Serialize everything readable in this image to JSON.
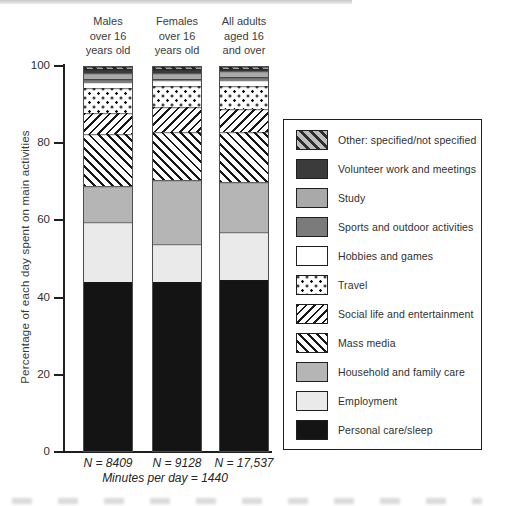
{
  "chart_data": {
    "type": "bar",
    "stacked": true,
    "title": "",
    "ylabel": "Percentage of each day spent on main activities",
    "xlabel": "",
    "ylim": [
      0,
      100
    ],
    "yticks": [
      0,
      20,
      40,
      60,
      80,
      100
    ],
    "grid": false,
    "legend_position": "right",
    "categories": [
      {
        "label_lines": [
          "Males",
          "over 16",
          "years old"
        ],
        "n_label": "N = 8409"
      },
      {
        "label_lines": [
          "Females",
          "over 16",
          "years old"
        ],
        "n_label": "N = 9128"
      },
      {
        "label_lines": [
          "All adults",
          "aged 16",
          "and over"
        ],
        "n_label": "N = 17,537"
      }
    ],
    "footnote": "Minutes per day = 1440",
    "series_bottom_to_top": [
      {
        "name": "Personal care/sleep",
        "pattern": "solid",
        "color": "#141414",
        "values": [
          44.0,
          44.0,
          44.5
        ]
      },
      {
        "name": "Employment",
        "pattern": "solid",
        "color": "#eaeaea",
        "values": [
          15.5,
          10.0,
          12.5
        ]
      },
      {
        "name": "Household and family care",
        "pattern": "solid",
        "color": "#b5b5b5",
        "values": [
          9.5,
          16.5,
          13.0
        ]
      },
      {
        "name": "Mass media",
        "pattern": "hatch-back",
        "color": "#161616",
        "values": [
          13.5,
          12.5,
          13.0
        ]
      },
      {
        "name": "Social life and entertainment",
        "pattern": "hatch-fwd",
        "color": "#161616",
        "values": [
          5.5,
          6.5,
          6.0
        ]
      },
      {
        "name": "Travel",
        "pattern": "dots",
        "color": "#0e0e0e",
        "values": [
          6.5,
          5.5,
          6.0
        ]
      },
      {
        "name": "Hobbies and games",
        "pattern": "solid",
        "color": "#ffffff",
        "values": [
          1.5,
          1.5,
          1.5
        ]
      },
      {
        "name": "Sports and outdoor activities",
        "pattern": "solid",
        "color": "#7b7b7b",
        "values": [
          1.0,
          0.5,
          1.0
        ]
      },
      {
        "name": "Study",
        "pattern": "solid",
        "color": "#a9a9a9",
        "values": [
          1.5,
          1.5,
          1.5
        ]
      },
      {
        "name": "Volunteer work and meetings",
        "pattern": "solid",
        "color": "#3b3b3b",
        "values": [
          1.0,
          1.0,
          0.5
        ]
      },
      {
        "name": "Other: specified/not specified",
        "pattern": "hatch-gray",
        "color": "#bdbdbd",
        "values": [
          0.5,
          0.5,
          0.5
        ]
      }
    ]
  }
}
